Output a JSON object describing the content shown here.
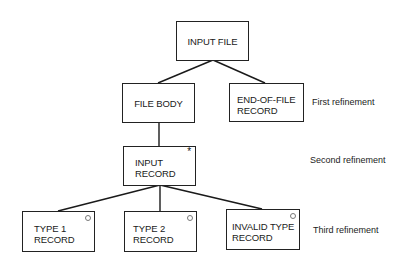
{
  "diagram": {
    "type": "jackson-structure-diagram",
    "nodes": [
      {
        "id": "input-file",
        "label": "INPUT FILE",
        "marker": ""
      },
      {
        "id": "file-body",
        "label": "FILE BODY",
        "marker": ""
      },
      {
        "id": "end-of-file-record",
        "label": "END-OF-FILE\nRECORD",
        "marker": ""
      },
      {
        "id": "input-record",
        "label": "INPUT\nRECORD",
        "marker": "*"
      },
      {
        "id": "type-1-record",
        "label": "TYPE 1\nRECORD",
        "marker": "o"
      },
      {
        "id": "type-2-record",
        "label": "TYPE 2\nRECORD",
        "marker": "o"
      },
      {
        "id": "invalid-type-record",
        "label": "INVALID TYPE\nRECORD",
        "marker": "o"
      }
    ],
    "edges": [
      {
        "from": "input-file",
        "to": "file-body"
      },
      {
        "from": "input-file",
        "to": "end-of-file-record"
      },
      {
        "from": "file-body",
        "to": "input-record"
      },
      {
        "from": "input-record",
        "to": "type-1-record"
      },
      {
        "from": "input-record",
        "to": "type-2-record"
      },
      {
        "from": "input-record",
        "to": "invalid-type-record"
      }
    ],
    "levels": [
      {
        "label": "First refinement"
      },
      {
        "label": "Second refinement"
      },
      {
        "label": "Third refinement"
      }
    ],
    "markers": {
      "iteration": "*",
      "selection": "o"
    }
  }
}
